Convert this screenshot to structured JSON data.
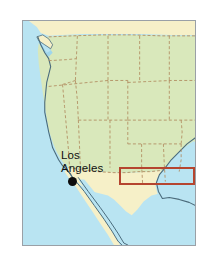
{
  "page": {
    "background_color": "#ffffff",
    "width": 212,
    "height": 265
  },
  "map": {
    "name": "western-united-states-map",
    "frame": {
      "border_color": "#9aa0a6",
      "x": 22,
      "y": 20,
      "width": 174,
      "height": 226
    },
    "colors": {
      "ocean": "#b9e4f2",
      "united_states_land": "#d9e8bb",
      "neighbor_land": "#f6f0c8",
      "coastline": "#4a6b7c",
      "state_boundary": "#b08a5e",
      "highlight_outline": "#b5452f",
      "city_marker": "#0d0d0d",
      "label_text": "#101010"
    },
    "labels": [
      {
        "name": "los-angeles",
        "line1": "Los",
        "line2": "Angeles"
      }
    ],
    "markers": [
      {
        "name": "los-angeles-dot",
        "shape": "filled-circle"
      }
    ],
    "highlight": {
      "name": "study-area-rectangle",
      "shape": "rectangle-outline",
      "color": "#b5452f"
    }
  }
}
